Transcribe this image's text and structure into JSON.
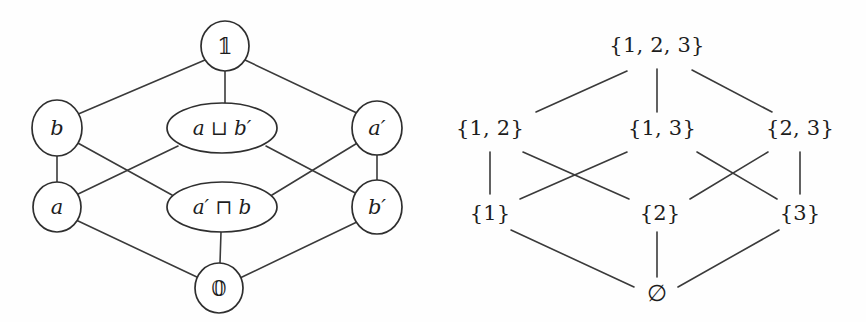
{
  "figure": {
    "background_color": "#ffffff",
    "line_color": "#3a3a3a",
    "text_color": "#1d1d1d"
  },
  "left_diagram": {
    "name": "boolean-lattice-diagram",
    "nodes": [
      {
        "id": "top",
        "label": "𝟙",
        "shape": "circle",
        "cx": 225,
        "cy": 46,
        "rx": 24,
        "ry": 25
      },
      {
        "id": "b",
        "label": "b",
        "shape": "circle",
        "cx": 57,
        "cy": 128,
        "rx": 25,
        "ry": 28
      },
      {
        "id": "join",
        "label": "a ⊔ b′",
        "shape": "ellipse",
        "cx": 222,
        "cy": 128,
        "rx": 55,
        "ry": 25
      },
      {
        "id": "aprime",
        "label": "a′",
        "shape": "circle",
        "cx": 377,
        "cy": 128,
        "rx": 25,
        "ry": 27
      },
      {
        "id": "a",
        "label": "a",
        "shape": "circle",
        "cx": 57,
        "cy": 207,
        "rx": 24,
        "ry": 25
      },
      {
        "id": "meet",
        "label": "a′ ⊓ b",
        "shape": "ellipse",
        "cx": 222,
        "cy": 207,
        "rx": 55,
        "ry": 25
      },
      {
        "id": "bprime",
        "label": "b′",
        "shape": "circle",
        "cx": 377,
        "cy": 207,
        "rx": 25,
        "ry": 27
      },
      {
        "id": "bottom",
        "label": "𝟘",
        "shape": "circle",
        "cx": 219,
        "cy": 288,
        "rx": 24,
        "ry": 25
      }
    ],
    "edges": [
      {
        "from": "top",
        "to": "b",
        "x1": 205,
        "y1": 60,
        "x2": 76,
        "y2": 115
      },
      {
        "from": "top",
        "to": "join",
        "x1": 225,
        "y1": 71,
        "x2": 225,
        "y2": 103
      },
      {
        "from": "top",
        "to": "aprime",
        "x1": 245,
        "y1": 60,
        "x2": 359,
        "y2": 114
      },
      {
        "from": "b",
        "to": "a",
        "x1": 57,
        "y1": 156,
        "x2": 57,
        "y2": 182
      },
      {
        "from": "b",
        "to": "meet",
        "x1": 76,
        "y1": 142,
        "x2": 172,
        "y2": 195
      },
      {
        "from": "join",
        "to": "a",
        "x1": 178,
        "y1": 146,
        "x2": 74,
        "y2": 196
      },
      {
        "from": "join",
        "to": "bprime",
        "x1": 266,
        "y1": 146,
        "x2": 361,
        "y2": 196
      },
      {
        "from": "aprime",
        "to": "meet",
        "x1": 359,
        "y1": 142,
        "x2": 272,
        "y2": 195
      },
      {
        "from": "aprime",
        "to": "bprime",
        "x1": 377,
        "y1": 155,
        "x2": 377,
        "y2": 180
      },
      {
        "from": "a",
        "to": "bottom",
        "x1": 76,
        "y1": 220,
        "x2": 199,
        "y2": 278
      },
      {
        "from": "meet",
        "to": "bottom",
        "x1": 221,
        "y1": 232,
        "x2": 220,
        "y2": 263
      },
      {
        "from": "bprime",
        "to": "bottom",
        "x1": 359,
        "y1": 221,
        "x2": 240,
        "y2": 278
      }
    ]
  },
  "right_diagram": {
    "name": "powerset-lattice-diagram",
    "nodes": [
      {
        "id": "s123",
        "label": "{1, 2, 3}",
        "cx": 657,
        "cy": 45
      },
      {
        "id": "s12",
        "label": "{1, 2}",
        "cx": 490,
        "cy": 128
      },
      {
        "id": "s13",
        "label": "{1, 3}",
        "cx": 662,
        "cy": 128
      },
      {
        "id": "s23",
        "label": "{2, 3}",
        "cx": 800,
        "cy": 128
      },
      {
        "id": "s1",
        "label": "{1}",
        "cx": 490,
        "cy": 213
      },
      {
        "id": "s2",
        "label": "{2}",
        "cx": 660,
        "cy": 213
      },
      {
        "id": "s3",
        "label": "{3}",
        "cx": 800,
        "cy": 213
      },
      {
        "id": "s0",
        "label": "∅",
        "cx": 657,
        "cy": 293
      }
    ],
    "edges": [
      {
        "from": "s123",
        "to": "s12",
        "x1": 627,
        "y1": 71,
        "x2": 536,
        "y2": 112
      },
      {
        "from": "s123",
        "to": "s13",
        "x1": 657,
        "y1": 69,
        "x2": 657,
        "y2": 112
      },
      {
        "from": "s123",
        "to": "s23",
        "x1": 692,
        "y1": 70,
        "x2": 772,
        "y2": 112
      },
      {
        "from": "s12",
        "to": "s1",
        "x1": 490,
        "y1": 152,
        "x2": 490,
        "y2": 194
      },
      {
        "from": "s12",
        "to": "s2",
        "x1": 523,
        "y1": 152,
        "x2": 629,
        "y2": 199
      },
      {
        "from": "s13",
        "to": "s1",
        "x1": 627,
        "y1": 152,
        "x2": 520,
        "y2": 199
      },
      {
        "from": "s13",
        "to": "s3",
        "x1": 697,
        "y1": 152,
        "x2": 777,
        "y2": 199
      },
      {
        "from": "s23",
        "to": "s2",
        "x1": 768,
        "y1": 152,
        "x2": 690,
        "y2": 199
      },
      {
        "from": "s23",
        "to": "s3",
        "x1": 800,
        "y1": 152,
        "x2": 800,
        "y2": 194
      },
      {
        "from": "s1",
        "to": "s0",
        "x1": 511,
        "y1": 230,
        "x2": 634,
        "y2": 287
      },
      {
        "from": "s2",
        "to": "s0",
        "x1": 657,
        "y1": 232,
        "x2": 657,
        "y2": 277
      },
      {
        "from": "s3",
        "to": "s0",
        "x1": 779,
        "y1": 230,
        "x2": 678,
        "y2": 287
      }
    ]
  }
}
